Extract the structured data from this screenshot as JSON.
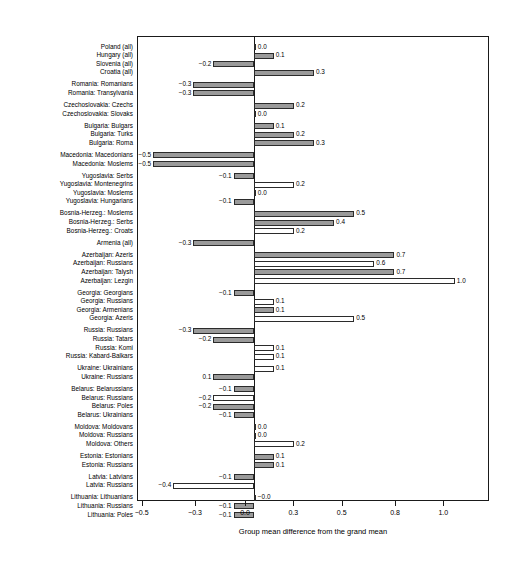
{
  "chart_data": {
    "type": "bar",
    "orientation": "horizontal",
    "title": "",
    "xlabel": "Group mean difference from the grand mean",
    "ylabel": "",
    "xlim": [
      -0.58,
      1.17
    ],
    "grid": false,
    "legend": null,
    "xticks": [
      -0.5,
      -0.3,
      0.0,
      0.3,
      0.5,
      0.8,
      1.0
    ],
    "xtick_labels": [
      "-0.5",
      "-0.3",
      "0.0",
      "0.3",
      "0.5",
      "0.8",
      "1.0"
    ],
    "zero_reference": 0.0,
    "categories": [
      "Poland (all)",
      "Hungary (all)",
      "Slovenia (all)",
      "Croatia (all)",
      "Romania: Romanians",
      "Romania: Transylvania",
      "Czechoslovakia: Czechs",
      "Czechoslovakia: Slovaks",
      "Bulgaria: Bulgars",
      "Bulgaria: Turks",
      "Bulgaria: Roma",
      "Macedonia: Macedonians",
      "Macedonia: Moslems",
      "Yugoslavia: Serbs",
      "Yugoslavia: Montenegrins",
      "Yugoslavia: Moslems",
      "Yugoslavia: Hungarians",
      "Bosnia-Herzeg.: Moslems",
      "Bosnia-Herzeg.: Serbs",
      "Bosnia-Herzeg.: Croats",
      "Armenia (all)",
      "Azerbaijan: Azeris",
      "Azerbaijan: Russians",
      "Azerbaijan: Talysh",
      "Azerbaijan: Lezgin",
      "Georgia: Georgians",
      "Georgia: Russians",
      "Georgia: Armenians",
      "Georgia: Azeris",
      "Russia: Russians",
      "Russia: Tatars",
      "Russia: Komi",
      "Russia: Kabard-Balkars",
      "Ukraine: Ukrainians",
      "Ukraine: Russians",
      "Belarus: Belarussians",
      "Belarus: Russians",
      "Belarus: Poles",
      "Belarus: Ukrainians",
      "Moldova: Moldovans",
      "Moldova: Russians",
      "Moldova: Others",
      "Estonia: Estonians",
      "Estonia: Russians",
      "Latvia: Latvians",
      "Latvia: Russians",
      "Lithuania: Lithuanians",
      "Lithuania: Russians",
      "Lithuania: Poles"
    ],
    "values": [
      0.0,
      0.1,
      -0.2,
      0.3,
      -0.3,
      -0.3,
      0.2,
      0.0,
      0.1,
      0.2,
      0.3,
      -0.5,
      -0.5,
      -0.1,
      0.2,
      0.0,
      -0.1,
      0.5,
      0.4,
      0.2,
      -0.3,
      0.7,
      0.6,
      0.7,
      1.0,
      -0.1,
      0.1,
      0.1,
      0.5,
      -0.3,
      -0.2,
      0.1,
      0.1,
      0.1,
      -0.2,
      -0.1,
      -0.2,
      -0.2,
      -0.1,
      0.0,
      0.0,
      0.2,
      0.1,
      0.1,
      -0.1,
      -0.4,
      -0.0,
      -0.1,
      -0.1
    ],
    "value_labels": [
      "0.0",
      "0.1",
      "-0.2",
      "0.3",
      "-0.3",
      "-0.3",
      "0.2",
      "0.0",
      "0.1",
      "0.2",
      "0.3",
      "-0.5",
      "-0.5",
      "-0.1",
      "0.2",
      "0.0",
      "-0.1",
      "0.5",
      "0.4",
      "0.2",
      "-0.3",
      "0.7",
      "0.6",
      "0.7",
      "1.0",
      "-0.1",
      "0.1",
      "0.1",
      "0.5",
      "-0.3",
      "-0.2",
      "0.1",
      "0.1",
      "0.1",
      "0.1",
      "-0.1",
      "-0.2",
      "-0.2",
      "-0.1",
      "0.0",
      "0.0",
      "0.2",
      "0.1",
      "0.1",
      "-0.1",
      "-0.4",
      "-0.0",
      "-0.1",
      "-0.1"
    ],
    "bar_fills": [
      "gray",
      "gray",
      "gray",
      "gray",
      "gray",
      "gray",
      "gray",
      "white",
      "gray",
      "gray",
      "gray",
      "gray",
      "gray",
      "gray",
      "white",
      "gray",
      "gray",
      "gray",
      "gray",
      "white",
      "gray",
      "gray",
      "white",
      "gray",
      "white",
      "gray",
      "white",
      "gray",
      "white",
      "gray",
      "gray",
      "white",
      "white",
      "white",
      "gray",
      "gray",
      "white",
      "gray",
      "gray",
      "gray",
      "white",
      "white",
      "gray",
      "gray",
      "gray",
      "white",
      "gray",
      "gray",
      "gray"
    ],
    "group_breaks_after": [
      3,
      5,
      7,
      10,
      12,
      16,
      19,
      20,
      24,
      28,
      32,
      34,
      38,
      41,
      43,
      45
    ],
    "colors": {
      "bar_gray": "#9a9a9a",
      "bar_white": "#ffffff",
      "bar_edge": "#2b2b2b",
      "axis": "#1a1a1a",
      "text": "#000000"
    }
  }
}
